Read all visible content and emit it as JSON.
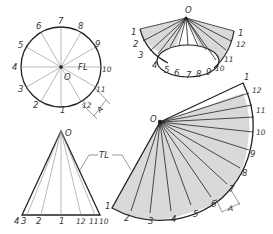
{
  "figure": {
    "colors": {
      "line": "#222222",
      "thin_line": "#666666",
      "fill": "#d9d9d9",
      "background": "#ffffff"
    }
  },
  "top_view": {
    "apex_label": "O",
    "fold_line_label": "FL",
    "dimension_label": "A",
    "points": [
      "1",
      "2",
      "3",
      "4",
      "5",
      "6",
      "7",
      "8",
      "9",
      "10",
      "11",
      "12"
    ]
  },
  "pictorial_view": {
    "apex_label": "O",
    "points": [
      "1",
      "2",
      "3",
      "4",
      "5",
      "6",
      "7",
      "8",
      "9",
      "10",
      "11",
      "12",
      "1"
    ]
  },
  "front_view": {
    "apex_label": "O",
    "true_length_label": "TL",
    "base_labels": [
      "4",
      "3",
      "2",
      "1",
      "12",
      "11",
      "10"
    ]
  },
  "development": {
    "apex_label": "O",
    "dimension_label": "A",
    "points": [
      "1",
      "2",
      "3",
      "4",
      "5",
      "6",
      "7",
      "8",
      "9",
      "10",
      "11",
      "12",
      "1"
    ]
  }
}
